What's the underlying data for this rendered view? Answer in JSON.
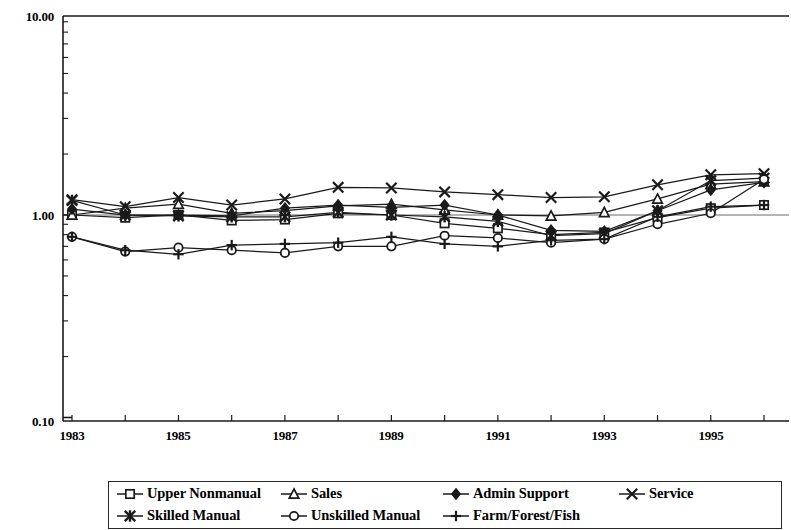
{
  "chart_data": {
    "type": "line",
    "title": "",
    "xlabel": "",
    "ylabel": "",
    "yscale": "log",
    "ylim": [
      0.1,
      10.0
    ],
    "y_ticklabels": [
      "10.00",
      "1.00",
      "0.10"
    ],
    "y_tickvalues": [
      10.0,
      1.0,
      0.1
    ],
    "grid": false,
    "legend_position": "bottom",
    "x": [
      1983,
      1984,
      1985,
      1986,
      1987,
      1988,
      1989,
      1990,
      1991,
      1992,
      1993,
      1994,
      1995,
      1996
    ],
    "x_ticklabels": [
      "1983",
      "1985",
      "1987",
      "1989",
      "1991",
      "1993",
      "1995"
    ],
    "x_tickvalues": [
      1983,
      1985,
      1987,
      1989,
      1991,
      1993,
      1995
    ],
    "series": [
      {
        "name": "Upper Nonmanual",
        "marker": "open-square",
        "values": [
          1.0,
          0.97,
          1.0,
          0.94,
          0.95,
          1.02,
          1.0,
          0.91,
          0.86,
          0.8,
          0.82,
          0.97,
          1.08,
          1.12
        ]
      },
      {
        "name": "Sales",
        "marker": "open-triangle",
        "values": [
          1.0,
          1.08,
          1.13,
          1.02,
          1.05,
          1.11,
          1.13,
          1.06,
          1.0,
          0.99,
          1.03,
          1.2,
          1.42,
          1.46
        ]
      },
      {
        "name": "Admin Support",
        "marker": "filled-diamond",
        "values": [
          1.07,
          1.0,
          1.0,
          0.99,
          1.08,
          1.12,
          1.09,
          1.12,
          1.0,
          0.84,
          0.83,
          1.05,
          1.33,
          1.45
        ]
      },
      {
        "name": "Service",
        "marker": "cross-x",
        "values": [
          1.19,
          1.1,
          1.22,
          1.12,
          1.2,
          1.37,
          1.36,
          1.3,
          1.26,
          1.22,
          1.23,
          1.41,
          1.58,
          1.6
        ]
      },
      {
        "name": "Skilled Manual",
        "marker": "filled-star",
        "values": [
          1.18,
          1.0,
          0.99,
          0.98,
          0.98,
          1.03,
          1.0,
          0.98,
          0.93,
          0.79,
          0.81,
          1.05,
          1.48,
          1.52
        ]
      },
      {
        "name": "Unskilled Manual",
        "marker": "open-circle",
        "values": [
          0.78,
          0.66,
          0.69,
          0.67,
          0.65,
          0.7,
          0.7,
          0.79,
          0.77,
          0.73,
          0.76,
          0.9,
          1.02,
          1.5
        ]
      },
      {
        "name": "Farm/Forest/Fish",
        "marker": "plus",
        "values": [
          0.78,
          0.67,
          0.64,
          0.71,
          0.72,
          0.73,
          0.78,
          0.72,
          0.7,
          0.75,
          0.76,
          0.98,
          1.1,
          1.12
        ]
      }
    ]
  },
  "axis": {
    "y_top_label": "10.00",
    "y_mid_label": "1.00",
    "y_bottom_label": "0.10",
    "x_labels": [
      "1983",
      "1985",
      "1987",
      "1989",
      "1991",
      "1993",
      "1995"
    ]
  },
  "legend": {
    "row1": [
      {
        "label": "Upper Nonmanual",
        "marker": "open-square"
      },
      {
        "label": "Sales",
        "marker": "open-triangle"
      },
      {
        "label": "Admin Support",
        "marker": "filled-diamond"
      },
      {
        "label": "Service",
        "marker": "cross-x"
      }
    ],
    "row2": [
      {
        "label": "Skilled Manual",
        "marker": "filled-star"
      },
      {
        "label": "Unskilled Manual",
        "marker": "open-circle"
      },
      {
        "label": "Farm/Forest/Fish",
        "marker": "plus"
      }
    ]
  },
  "colors": {
    "line": "#1a1a1a",
    "axis": "#1a1a1a",
    "background": "#ffffff"
  }
}
